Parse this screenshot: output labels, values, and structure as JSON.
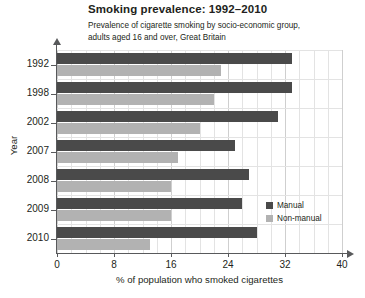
{
  "chart_data": {
    "type": "bar",
    "orientation": "horizontal",
    "title": "Smoking prevalence: 1992–2010",
    "subtitle": "Prevalence of cigarette smoking by socio-economic group, adults aged 16 and over, Great Britain",
    "xlabel": "% of population who smoked cigarettes",
    "ylabel": "Year",
    "categories": [
      "1992",
      "1998",
      "2002",
      "2007",
      "2008",
      "2009",
      "2010"
    ],
    "series": [
      {
        "name": "Manual",
        "color": "#4a4a4a",
        "values": [
          33,
          33,
          31,
          25,
          27,
          26,
          28
        ]
      },
      {
        "name": "Non-manual",
        "color": "#b2b2b2",
        "values": [
          23,
          22,
          20,
          17,
          16,
          16,
          13
        ]
      }
    ],
    "xlim": [
      0,
      40
    ],
    "xticks": [
      "0",
      "8",
      "16",
      "24",
      "32",
      "40"
    ],
    "xtick_values": [
      0,
      8,
      16,
      24,
      32,
      40
    ],
    "grid": true,
    "grid_step": 2,
    "legend_position": "inside-right-lower"
  },
  "legend": {
    "items": [
      {
        "label": "Manual",
        "color": "#4a4a4a"
      },
      {
        "label": "Non-manual",
        "color": "#b2b2b2"
      }
    ]
  },
  "colors": {
    "manual": "#4a4a4a",
    "non_manual": "#b2b2b2",
    "axis": "#58595b",
    "grid": "#e3e3e3",
    "text": "#231f20",
    "background": "#ffffff"
  }
}
